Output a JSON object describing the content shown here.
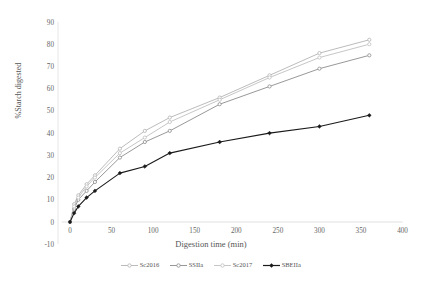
{
  "chart_data": {
    "type": "line",
    "title": "",
    "xlabel": "Digestion time (min)",
    "ylabel": "%Starch digested",
    "xlim": [
      -10,
      400
    ],
    "ylim": [
      -10,
      90
    ],
    "xticks": [
      0,
      50,
      100,
      150,
      200,
      250,
      300,
      350,
      400
    ],
    "yticks": [
      -10,
      0,
      10,
      20,
      30,
      40,
      50,
      60,
      70,
      80,
      90
    ],
    "grid": false,
    "legend_position": "bottom",
    "x": [
      0,
      5,
      10,
      20,
      30,
      60,
      90,
      120,
      180,
      240,
      300,
      360
    ],
    "series": [
      {
        "name": "Sc2016",
        "color": "#b3b3b3",
        "marker": "circle-open",
        "values": [
          0,
          8,
          12,
          17,
          21,
          33,
          41,
          47,
          56,
          66,
          76,
          82
        ]
      },
      {
        "name": "SSIIa",
        "color": "#8c8c8c",
        "marker": "circle-open",
        "values": [
          0,
          6,
          10,
          14,
          18,
          29,
          36,
          41,
          53,
          61,
          69,
          75
        ]
      },
      {
        "name": "Sc2017",
        "color": "#bfbfbf",
        "marker": "circle-open",
        "values": [
          0,
          7,
          11,
          16,
          20,
          31,
          38,
          45,
          55,
          65,
          74,
          80
        ]
      },
      {
        "name": "SBEIIa",
        "color": "#1a1a1a",
        "marker": "diamond-filled",
        "values": [
          0,
          4,
          7,
          11,
          14,
          22,
          25,
          31,
          36,
          40,
          43,
          48
        ]
      }
    ]
  },
  "axis": {
    "y_title": "%Starch digested",
    "x_title": "Digestion time (min)",
    "y_tick_labels": [
      "90",
      "80",
      "70",
      "60",
      "50",
      "40",
      "30",
      "20",
      "10",
      "0",
      "-10"
    ],
    "x_tick_labels": [
      "0",
      "50",
      "100",
      "150",
      "200",
      "250",
      "300",
      "350",
      "400"
    ]
  },
  "legend": {
    "items": [
      {
        "label": "Sc2016"
      },
      {
        "label": "SSIIa"
      },
      {
        "label": "Sc2017"
      },
      {
        "label": "SBEIIa"
      }
    ]
  }
}
